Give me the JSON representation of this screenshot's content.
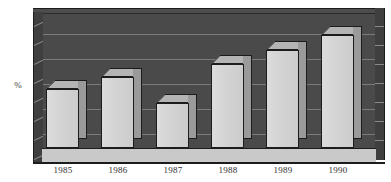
{
  "chart_data": {
    "type": "bar",
    "title": "",
    "subtitle": "",
    "xlabel": "",
    "ylabel": "%",
    "categories": [
      "1985",
      "1986",
      "1987",
      "1988",
      "1989",
      "1990"
    ],
    "values": [
      45,
      54,
      34,
      64,
      75,
      86
    ],
    "series": [
      {
        "name": "",
        "values": [
          45,
          54,
          34,
          64,
          75,
          86
        ]
      }
    ],
    "ylim": [
      0,
      100
    ],
    "grid": true,
    "gridlines": [
      20,
      40,
      60,
      80,
      100
    ],
    "legend": "none",
    "style": "3d-bar-grayscale",
    "tick_labels_y": [],
    "annotations": []
  },
  "axis": {
    "y_caption": "%"
  },
  "colors": {
    "plot_background": "#4a4a4a",
    "gridline": "#7b7b7b",
    "bar_front": "#d2d2d2",
    "bar_side": "#9a9a9a",
    "bar_top": "#b4b4b4",
    "outline": "#1c1c1c",
    "floor": "#c9c9c9",
    "wall": "#3f3f3f",
    "page_background": "#ffffff",
    "label_text": "#2e2e2e"
  }
}
